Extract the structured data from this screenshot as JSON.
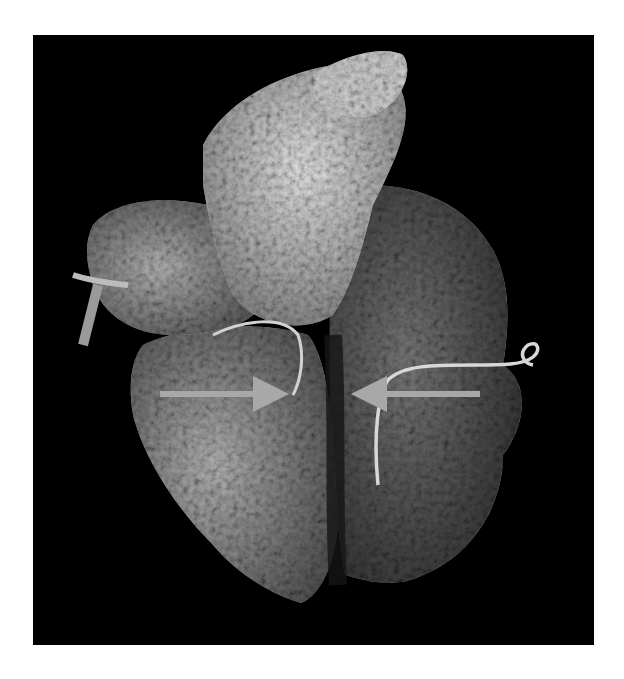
{
  "figure": {
    "background_color": "#000000",
    "page_color": "#ffffff",
    "tissue_colors": {
      "bright": "#d9d9d9",
      "mid": "#8a8a8a",
      "dark": "#3a3a3a"
    },
    "annotations": {
      "arrow_color": "#a8a8a8",
      "arrows": [
        {
          "id": "left-arrow",
          "direction": "right",
          "x1": 160,
          "x2": 282,
          "y": 394
        },
        {
          "id": "right-arrow",
          "direction": "left",
          "x1": 480,
          "x2": 358,
          "y": 394
        }
      ]
    }
  }
}
